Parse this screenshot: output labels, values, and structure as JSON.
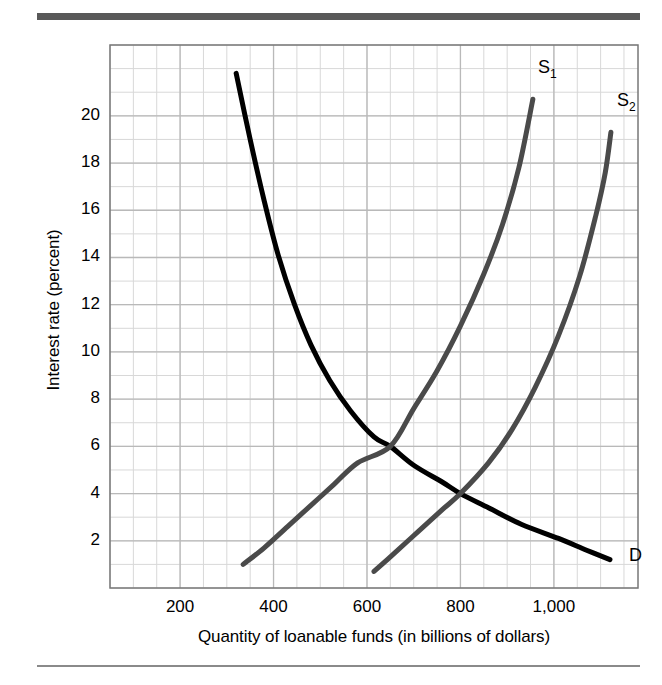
{
  "figure": {
    "background_color": "#ffffff",
    "top_rule_color": "#595959",
    "bottom_rule_color": "#8a8a8a"
  },
  "chart_data": {
    "type": "line",
    "title": "",
    "xlabel": "Quantity of loanable funds (in billions of dollars)",
    "ylabel": "Interest rate (percent)",
    "xlim": [
      50,
      1180
    ],
    "ylim": [
      0,
      23
    ],
    "xticks": [
      200,
      400,
      600,
      800,
      1000
    ],
    "xticklabels": [
      "200",
      "400",
      "600",
      "800",
      "1,000"
    ],
    "yticks": [
      2,
      4,
      6,
      8,
      10,
      12,
      14,
      16,
      18,
      20
    ],
    "yticklabels": [
      "2",
      "4",
      "6",
      "8",
      "10",
      "12",
      "14",
      "16",
      "18",
      "20"
    ],
    "grid": true,
    "grid_minor": true,
    "grid_color": "#b9b9b9",
    "grid_minor_color": "#d8d8d8",
    "grid_step_x": 50,
    "grid_step_y": 1,
    "legend": "inline-labels",
    "series": [
      {
        "name": "D",
        "label": "D",
        "role": "demand",
        "color": "#000000",
        "linewidth": 5,
        "points": [
          [
            320,
            21.8
          ],
          [
            350,
            19.0
          ],
          [
            380,
            16.4
          ],
          [
            410,
            14.1
          ],
          [
            445,
            12.0
          ],
          [
            480,
            10.3
          ],
          [
            520,
            8.8
          ],
          [
            565,
            7.5
          ],
          [
            615,
            6.4
          ],
          [
            650,
            6.0
          ],
          [
            700,
            5.2
          ],
          [
            760,
            4.5
          ],
          [
            800,
            4.0
          ],
          [
            860,
            3.4
          ],
          [
            930,
            2.7
          ],
          [
            1010,
            2.1
          ],
          [
            1070,
            1.6
          ],
          [
            1120,
            1.2
          ]
        ],
        "label_pos": [
          1148,
          1.3
        ]
      },
      {
        "name": "S1",
        "label": "S₁",
        "role": "supply-original",
        "color": "#4a4a4a",
        "linewidth": 5,
        "points": [
          [
            335,
            1.0
          ],
          [
            380,
            1.7
          ],
          [
            430,
            2.6
          ],
          [
            480,
            3.5
          ],
          [
            530,
            4.4
          ],
          [
            580,
            5.3
          ],
          [
            650,
            6.0
          ],
          [
            700,
            7.6
          ],
          [
            750,
            9.2
          ],
          [
            800,
            11.1
          ],
          [
            850,
            13.3
          ],
          [
            890,
            15.4
          ],
          [
            925,
            17.8
          ],
          [
            955,
            20.7
          ]
        ],
        "label_pos": [
          953,
          22.0
        ]
      },
      {
        "name": "S2",
        "label": "S₂",
        "role": "supply-shifted",
        "color": "#4a4a4a",
        "linewidth": 5,
        "points": [
          [
            615,
            0.7
          ],
          [
            660,
            1.5
          ],
          [
            710,
            2.4
          ],
          [
            760,
            3.3
          ],
          [
            800,
            4.0
          ],
          [
            860,
            5.3
          ],
          [
            910,
            6.7
          ],
          [
            960,
            8.5
          ],
          [
            1010,
            10.7
          ],
          [
            1055,
            13.2
          ],
          [
            1090,
            15.8
          ],
          [
            1110,
            17.6
          ],
          [
            1122,
            19.3
          ]
        ],
        "label_pos": [
          1122,
          20.6
        ]
      }
    ],
    "annotations": [
      {
        "name": "equilibrium-original",
        "x": 650,
        "y": 6
      },
      {
        "name": "equilibrium-shifted",
        "x": 800,
        "y": 4
      }
    ]
  }
}
